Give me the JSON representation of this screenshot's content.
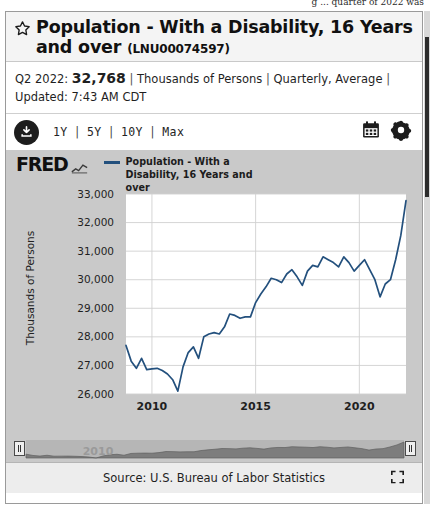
{
  "page_top_text": "g ... quarter of 2022 was",
  "widget": {
    "favorite_icon": "star-icon",
    "title": "Population - With a Disability, 16 Years and over",
    "series_id": "(LNU00074597)",
    "meta": {
      "period_label": "Q2 2022:",
      "value": "32,768",
      "units": "Thousands of Persons",
      "frequency": "Quarterly, Average",
      "updated": "Updated: 7:43 AM CDT",
      "separator": "|"
    },
    "toolbar": {
      "download_icon": "download-icon",
      "ranges": [
        "1Y",
        "5Y",
        "10Y",
        "Max"
      ],
      "range_separator": "|",
      "calendar_icon": "calendar-icon",
      "settings_icon": "gear-icon"
    },
    "brand": "FRED",
    "brand_icon": "fred-squiggle-icon",
    "legend": [
      {
        "label": "Population - With a Disability, 16 Years and over",
        "color": "#23507d"
      }
    ],
    "scrubber": {
      "watermark": "2010",
      "left_handle": "scrubber-left-handle",
      "right_handle": "scrubber-right-handle"
    },
    "footer": {
      "source": "Source: U.S. Bureau of Labor Statistics",
      "expand_icon": "fullscreen-icon"
    }
  },
  "chart_data": {
    "type": "line",
    "title": "Population - With a Disability, 16 Years and over",
    "xlabel": "",
    "ylabel": "Thousands of Persons",
    "ylim": [
      26000,
      33000
    ],
    "yticks": [
      26000,
      27000,
      28000,
      29000,
      30000,
      31000,
      32000,
      33000
    ],
    "ytick_labels": [
      "26,000",
      "27,000",
      "28,000",
      "29,000",
      "30,000",
      "31,000",
      "32,000",
      "33,000"
    ],
    "xlim": [
      2008.75,
      2022.25
    ],
    "xticks": [
      2010,
      2015,
      2020
    ],
    "xtick_labels": [
      "2010",
      "2015",
      "2020"
    ],
    "grid": true,
    "legend_position": "top-left",
    "line_color": "#23507d",
    "series": [
      {
        "name": "Population - With a Disability, 16 Years and over",
        "x": [
          2008.75,
          2009.0,
          2009.25,
          2009.5,
          2009.75,
          2010.0,
          2010.25,
          2010.5,
          2010.75,
          2011.0,
          2011.25,
          2011.5,
          2011.75,
          2012.0,
          2012.25,
          2012.5,
          2012.75,
          2013.0,
          2013.25,
          2013.5,
          2013.75,
          2014.0,
          2014.25,
          2014.5,
          2014.75,
          2015.0,
          2015.25,
          2015.5,
          2015.75,
          2016.0,
          2016.25,
          2016.5,
          2016.75,
          2017.0,
          2017.25,
          2017.5,
          2017.75,
          2018.0,
          2018.25,
          2018.5,
          2018.75,
          2019.0,
          2019.25,
          2019.5,
          2019.75,
          2020.0,
          2020.25,
          2020.5,
          2020.75,
          2021.0,
          2021.25,
          2021.5,
          2021.75,
          2022.0,
          2022.25
        ],
        "y": [
          27700,
          27150,
          26900,
          27250,
          26850,
          26880,
          26900,
          26820,
          26700,
          26500,
          26100,
          26950,
          27450,
          27650,
          27250,
          28000,
          28100,
          28150,
          28100,
          28350,
          28800,
          28750,
          28650,
          28700,
          28700,
          29200,
          29500,
          29750,
          30050,
          30000,
          29900,
          30200,
          30350,
          30100,
          29800,
          30300,
          30500,
          30450,
          30800,
          30700,
          30600,
          30450,
          30800,
          30600,
          30300,
          30500,
          30700,
          30350,
          30000,
          29400,
          29850,
          30000,
          30700,
          31550,
          32768
        ]
      }
    ],
    "recession_marker_year": 2020
  }
}
